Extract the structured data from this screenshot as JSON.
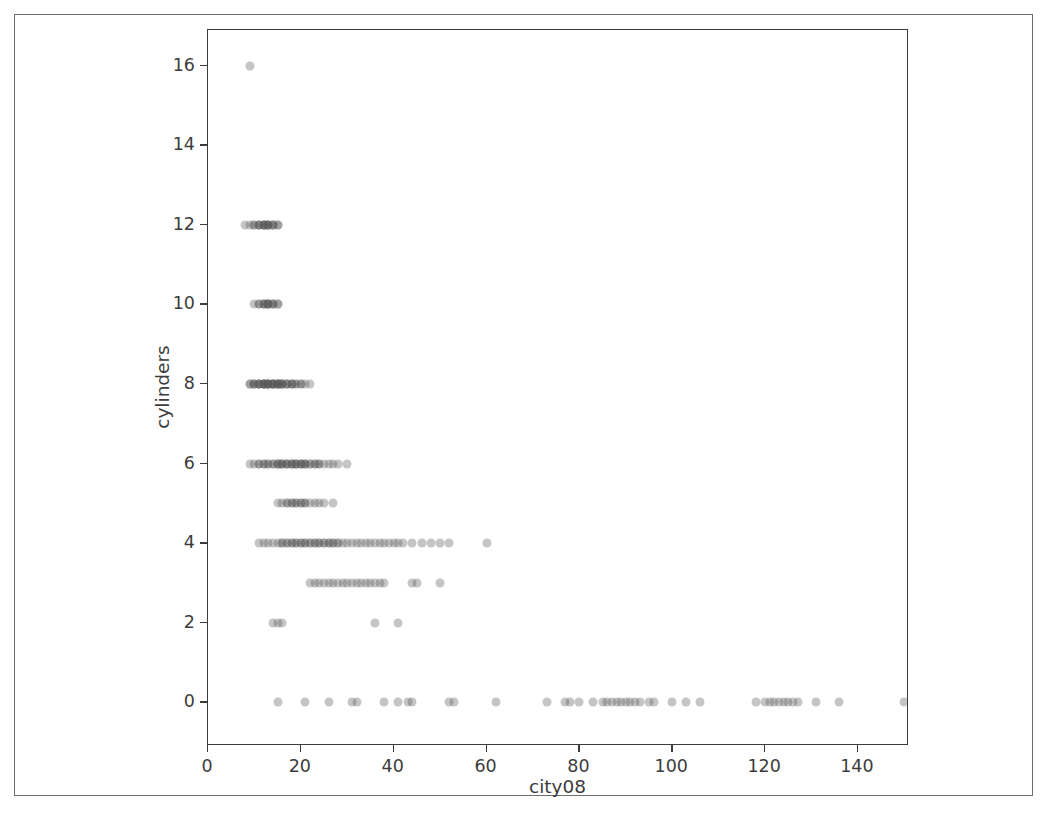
{
  "figure": {
    "background_color": "#ffffff",
    "frame_color": "#6d6d6d",
    "axes_color": "#3b3b3b",
    "marker_color": "#595959"
  },
  "chart_data": {
    "type": "scatter",
    "title": "",
    "xlabel": "city08",
    "ylabel": "cylinders",
    "xlim": [
      0,
      151
    ],
    "ylim": [
      -1.1,
      16.9
    ],
    "grid": false,
    "legend": null,
    "xticks": [
      0,
      20,
      40,
      60,
      80,
      100,
      120,
      140
    ],
    "xticklabels": [
      "0",
      "20",
      "40",
      "60",
      "80",
      "100",
      "120",
      "140"
    ],
    "yticks": [
      0,
      2,
      4,
      6,
      8,
      10,
      12,
      14,
      16
    ],
    "yticklabels": [
      "0",
      "2",
      "4",
      "6",
      "8",
      "10",
      "12",
      "14",
      "16"
    ],
    "marker": {
      "shape": "circle",
      "size_px": 9,
      "color": "#595959",
      "alpha": 0.35
    },
    "series": [
      {
        "name": "vehicles",
        "points": [
          [
            9,
            16
          ],
          [
            8,
            12
          ],
          [
            9,
            12
          ],
          [
            10,
            12
          ],
          [
            10,
            12
          ],
          [
            11,
            12
          ],
          [
            11,
            12
          ],
          [
            11,
            12
          ],
          [
            12,
            12
          ],
          [
            12,
            12
          ],
          [
            12,
            12
          ],
          [
            12,
            12
          ],
          [
            13,
            12
          ],
          [
            13,
            12
          ],
          [
            13,
            12
          ],
          [
            13,
            12
          ],
          [
            14,
            12
          ],
          [
            14,
            12
          ],
          [
            14,
            12
          ],
          [
            15,
            12
          ],
          [
            15,
            12
          ],
          [
            10,
            10
          ],
          [
            11,
            10
          ],
          [
            11,
            10
          ],
          [
            12,
            10
          ],
          [
            12,
            10
          ],
          [
            12,
            10
          ],
          [
            13,
            10
          ],
          [
            13,
            10
          ],
          [
            13,
            10
          ],
          [
            13,
            10
          ],
          [
            14,
            10
          ],
          [
            14,
            10
          ],
          [
            14,
            10
          ],
          [
            15,
            10
          ],
          [
            15,
            10
          ],
          [
            9,
            8
          ],
          [
            9,
            8
          ],
          [
            10,
            8
          ],
          [
            10,
            8
          ],
          [
            10,
            8
          ],
          [
            11,
            8
          ],
          [
            11,
            8
          ],
          [
            11,
            8
          ],
          [
            11,
            8
          ],
          [
            12,
            8
          ],
          [
            12,
            8
          ],
          [
            12,
            8
          ],
          [
            12,
            8
          ],
          [
            12,
            8
          ],
          [
            13,
            8
          ],
          [
            13,
            8
          ],
          [
            13,
            8
          ],
          [
            13,
            8
          ],
          [
            13,
            8
          ],
          [
            14,
            8
          ],
          [
            14,
            8
          ],
          [
            14,
            8
          ],
          [
            14,
            8
          ],
          [
            14,
            8
          ],
          [
            15,
            8
          ],
          [
            15,
            8
          ],
          [
            15,
            8
          ],
          [
            15,
            8
          ],
          [
            15,
            8
          ],
          [
            16,
            8
          ],
          [
            16,
            8
          ],
          [
            16,
            8
          ],
          [
            16,
            8
          ],
          [
            17,
            8
          ],
          [
            17,
            8
          ],
          [
            17,
            8
          ],
          [
            18,
            8
          ],
          [
            18,
            8
          ],
          [
            18,
            8
          ],
          [
            19,
            8
          ],
          [
            19,
            8
          ],
          [
            20,
            8
          ],
          [
            20,
            8
          ],
          [
            21,
            8
          ],
          [
            22,
            8
          ],
          [
            9,
            6
          ],
          [
            10,
            6
          ],
          [
            11,
            6
          ],
          [
            11,
            6
          ],
          [
            12,
            6
          ],
          [
            12,
            6
          ],
          [
            13,
            6
          ],
          [
            13,
            6
          ],
          [
            14,
            6
          ],
          [
            14,
            6
          ],
          [
            15,
            6
          ],
          [
            15,
            6
          ],
          [
            15,
            6
          ],
          [
            16,
            6
          ],
          [
            16,
            6
          ],
          [
            16,
            6
          ],
          [
            17,
            6
          ],
          [
            17,
            6
          ],
          [
            17,
            6
          ],
          [
            18,
            6
          ],
          [
            18,
            6
          ],
          [
            18,
            6
          ],
          [
            19,
            6
          ],
          [
            19,
            6
          ],
          [
            19,
            6
          ],
          [
            20,
            6
          ],
          [
            20,
            6
          ],
          [
            20,
            6
          ],
          [
            21,
            6
          ],
          [
            21,
            6
          ],
          [
            21,
            6
          ],
          [
            22,
            6
          ],
          [
            22,
            6
          ],
          [
            23,
            6
          ],
          [
            23,
            6
          ],
          [
            24,
            6
          ],
          [
            24,
            6
          ],
          [
            25,
            6
          ],
          [
            26,
            6
          ],
          [
            27,
            6
          ],
          [
            28,
            6
          ],
          [
            30,
            6
          ],
          [
            15,
            5
          ],
          [
            16,
            5
          ],
          [
            17,
            5
          ],
          [
            17,
            5
          ],
          [
            18,
            5
          ],
          [
            18,
            5
          ],
          [
            19,
            5
          ],
          [
            19,
            5
          ],
          [
            20,
            5
          ],
          [
            20,
            5
          ],
          [
            21,
            5
          ],
          [
            21,
            5
          ],
          [
            22,
            5
          ],
          [
            23,
            5
          ],
          [
            24,
            5
          ],
          [
            25,
            5
          ],
          [
            27,
            5
          ],
          [
            11,
            4
          ],
          [
            12,
            4
          ],
          [
            13,
            4
          ],
          [
            14,
            4
          ],
          [
            15,
            4
          ],
          [
            16,
            4
          ],
          [
            16,
            4
          ],
          [
            17,
            4
          ],
          [
            17,
            4
          ],
          [
            18,
            4
          ],
          [
            18,
            4
          ],
          [
            19,
            4
          ],
          [
            19,
            4
          ],
          [
            20,
            4
          ],
          [
            20,
            4
          ],
          [
            21,
            4
          ],
          [
            21,
            4
          ],
          [
            22,
            4
          ],
          [
            22,
            4
          ],
          [
            23,
            4
          ],
          [
            23,
            4
          ],
          [
            24,
            4
          ],
          [
            24,
            4
          ],
          [
            25,
            4
          ],
          [
            25,
            4
          ],
          [
            26,
            4
          ],
          [
            26,
            4
          ],
          [
            27,
            4
          ],
          [
            27,
            4
          ],
          [
            28,
            4
          ],
          [
            28,
            4
          ],
          [
            29,
            4
          ],
          [
            30,
            4
          ],
          [
            31,
            4
          ],
          [
            32,
            4
          ],
          [
            33,
            4
          ],
          [
            34,
            4
          ],
          [
            35,
            4
          ],
          [
            36,
            4
          ],
          [
            37,
            4
          ],
          [
            38,
            4
          ],
          [
            39,
            4
          ],
          [
            40,
            4
          ],
          [
            41,
            4
          ],
          [
            42,
            4
          ],
          [
            44,
            4
          ],
          [
            46,
            4
          ],
          [
            48,
            4
          ],
          [
            50,
            4
          ],
          [
            52,
            4
          ],
          [
            60,
            4
          ],
          [
            22,
            3
          ],
          [
            23,
            3
          ],
          [
            24,
            3
          ],
          [
            25,
            3
          ],
          [
            26,
            3
          ],
          [
            27,
            3
          ],
          [
            28,
            3
          ],
          [
            29,
            3
          ],
          [
            30,
            3
          ],
          [
            31,
            3
          ],
          [
            32,
            3
          ],
          [
            33,
            3
          ],
          [
            34,
            3
          ],
          [
            35,
            3
          ],
          [
            36,
            3
          ],
          [
            37,
            3
          ],
          [
            38,
            3
          ],
          [
            44,
            3
          ],
          [
            45,
            3
          ],
          [
            50,
            3
          ],
          [
            14,
            2
          ],
          [
            15,
            2
          ],
          [
            16,
            2
          ],
          [
            36,
            2
          ],
          [
            41,
            2
          ],
          [
            15,
            0
          ],
          [
            21,
            0
          ],
          [
            26,
            0
          ],
          [
            31,
            0
          ],
          [
            32,
            0
          ],
          [
            38,
            0
          ],
          [
            41,
            0
          ],
          [
            43,
            0
          ],
          [
            44,
            0
          ],
          [
            52,
            0
          ],
          [
            53,
            0
          ],
          [
            62,
            0
          ],
          [
            73,
            0
          ],
          [
            77,
            0
          ],
          [
            78,
            0
          ],
          [
            80,
            0
          ],
          [
            83,
            0
          ],
          [
            85,
            0
          ],
          [
            86,
            0
          ],
          [
            87,
            0
          ],
          [
            88,
            0
          ],
          [
            89,
            0
          ],
          [
            90,
            0
          ],
          [
            91,
            0
          ],
          [
            92,
            0
          ],
          [
            93,
            0
          ],
          [
            95,
            0
          ],
          [
            96,
            0
          ],
          [
            100,
            0
          ],
          [
            103,
            0
          ],
          [
            106,
            0
          ],
          [
            118,
            0
          ],
          [
            120,
            0
          ],
          [
            121,
            0
          ],
          [
            122,
            0
          ],
          [
            123,
            0
          ],
          [
            124,
            0
          ],
          [
            125,
            0
          ],
          [
            126,
            0
          ],
          [
            127,
            0
          ],
          [
            131,
            0
          ],
          [
            136,
            0
          ],
          [
            150,
            0
          ]
        ]
      }
    ]
  }
}
